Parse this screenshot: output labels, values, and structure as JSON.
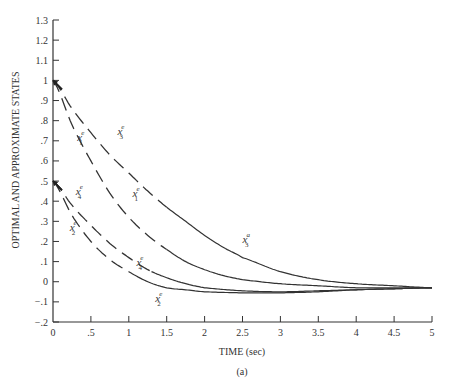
{
  "chart_data": {
    "type": "line",
    "title": "",
    "xlabel": "TIME (sec)",
    "ylabel": "OPTIMAL AND APPROXIMATE STATES",
    "caption": "(a)",
    "xlim": [
      0,
      5
    ],
    "ylim": [
      -0.2,
      1.3
    ],
    "grid": false,
    "x_ticks": [
      0,
      0.5,
      1,
      1.5,
      2,
      2.5,
      3,
      3.5,
      4,
      4.5,
      5
    ],
    "x_tick_labels": [
      "0",
      ".5",
      "1",
      "1.5",
      "2",
      "2.5",
      "3",
      "3.5",
      "4",
      "4.5",
      "5"
    ],
    "y_ticks": [
      -0.2,
      -0.1,
      0,
      0.1,
      0.2,
      0.3,
      0.4,
      0.5,
      0.6,
      0.7,
      0.8,
      0.9,
      1,
      1.1,
      1.2,
      1.3
    ],
    "y_tick_labels": [
      "−.2",
      "−.1",
      "0",
      ".1",
      ".2",
      ".3",
      ".4",
      ".5",
      ".6",
      ".7",
      ".8",
      ".9",
      "1",
      "1.1",
      "1.2",
      "1.3"
    ],
    "series": [
      {
        "name": "x3",
        "x": [
          0,
          0.25,
          0.5,
          0.75,
          1,
          1.25,
          1.5,
          1.75,
          2,
          2.25,
          2.5,
          3,
          3.5,
          4,
          4.5,
          5
        ],
        "values": [
          1.0,
          0.86,
          0.74,
          0.63,
          0.54,
          0.45,
          0.37,
          0.3,
          0.23,
          0.17,
          0.12,
          0.05,
          0.01,
          -0.01,
          -0.02,
          -0.03
        ],
        "dashed_until": 1.5,
        "labels": [
          {
            "base": "x",
            "sup": "e",
            "sub": "3",
            "at": [
              0.85,
              0.73
            ]
          },
          {
            "base": "x",
            "sup": "a",
            "sub": "3",
            "at": [
              2.5,
              0.19
            ]
          }
        ]
      },
      {
        "name": "x1",
        "x": [
          0,
          0.25,
          0.5,
          0.75,
          1,
          1.25,
          1.5,
          1.75,
          2,
          2.25,
          2.5,
          3,
          3.5,
          4,
          4.5,
          5
        ],
        "values": [
          1.0,
          0.78,
          0.6,
          0.44,
          0.32,
          0.23,
          0.16,
          0.1,
          0.06,
          0.03,
          0.01,
          -0.01,
          -0.02,
          -0.03,
          -0.03,
          -0.03
        ],
        "dashed_until": 1.5,
        "labels": [
          {
            "base": "x",
            "sup": "e",
            "sub": "1",
            "at": [
              0.32,
              0.7
            ]
          },
          {
            "base": "x",
            "sup": "e",
            "sub": "1",
            "at": [
              1.05,
              0.42
            ]
          }
        ]
      },
      {
        "name": "x4",
        "x": [
          0,
          0.25,
          0.5,
          0.75,
          1,
          1.25,
          1.5,
          1.75,
          2,
          2.5,
          3,
          3.5,
          4,
          4.5,
          5
        ],
        "values": [
          0.5,
          0.38,
          0.28,
          0.19,
          0.12,
          0.06,
          0.02,
          -0.01,
          -0.03,
          -0.045,
          -0.05,
          -0.045,
          -0.04,
          -0.035,
          -0.03
        ],
        "dashed_until": 1.3,
        "labels": [
          {
            "base": "x",
            "sup": "e",
            "sub": "4",
            "at": [
              0.3,
              0.43
            ]
          },
          {
            "base": "x",
            "sup": "e",
            "sub": "4",
            "at": [
              1.1,
              0.08
            ]
          }
        ]
      },
      {
        "name": "x2",
        "x": [
          0,
          0.25,
          0.5,
          0.75,
          1,
          1.25,
          1.5,
          1.75,
          2,
          2.5,
          3,
          3.5,
          4,
          4.5,
          5
        ],
        "values": [
          0.5,
          0.33,
          0.2,
          0.11,
          0.05,
          0.0,
          -0.03,
          -0.04,
          -0.05,
          -0.055,
          -0.055,
          -0.05,
          -0.04,
          -0.035,
          -0.03
        ],
        "dashed_until": 1.0,
        "labels": [
          {
            "base": "x",
            "sup": "e",
            "sub": "2",
            "at": [
              0.22,
              0.25
            ]
          },
          {
            "base": "x",
            "sup": "e",
            "sub": "2",
            "at": [
              1.35,
              -0.1
            ]
          }
        ]
      }
    ]
  }
}
